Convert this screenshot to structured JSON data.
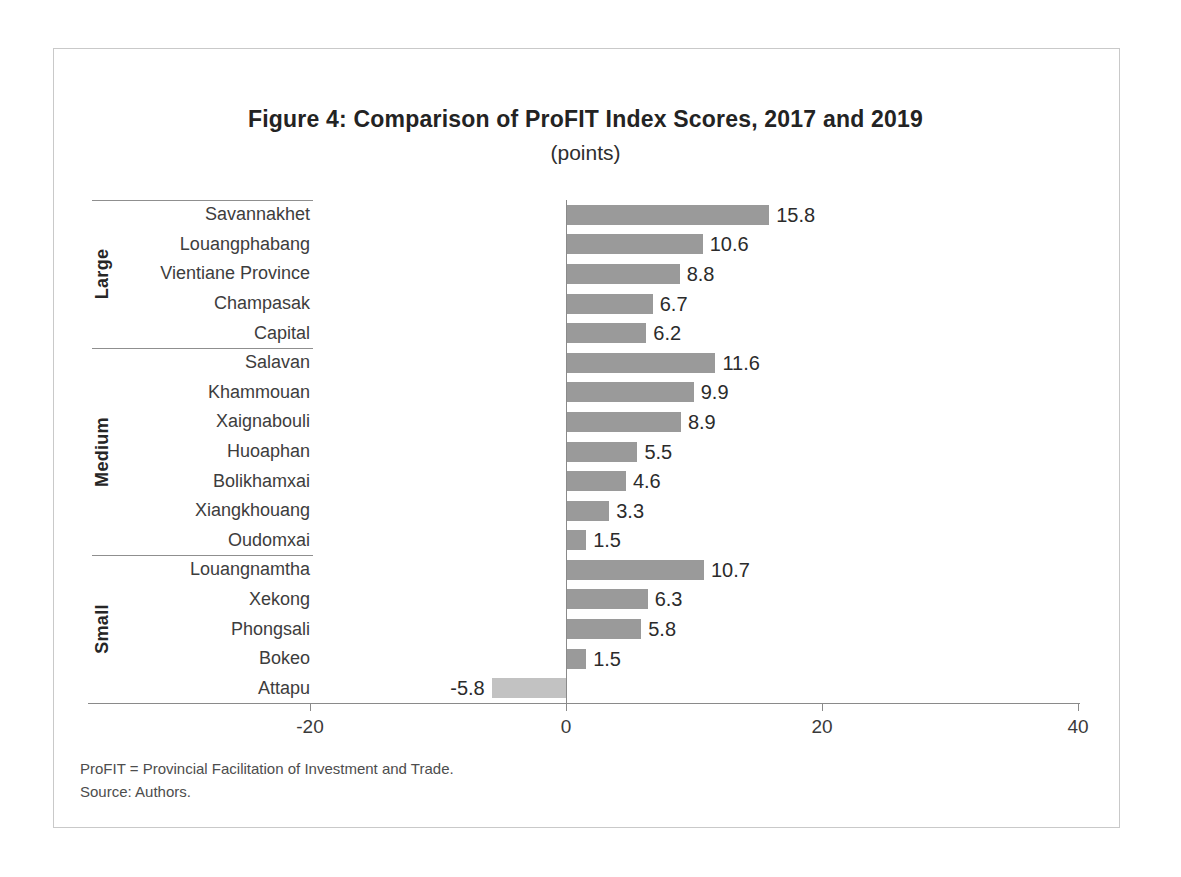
{
  "figure": {
    "title": "Figure 4: Comparison of ProFIT Index Scores, 2017 and 2019",
    "subtitle": "(points)",
    "footnotes": {
      "abbreviation": "ProFIT = Provincial Facilitation of Investment and Trade.",
      "source": "Source: Authors."
    }
  },
  "chart_data": {
    "type": "bar",
    "orientation": "horizontal",
    "title": "Figure 4: Comparison of ProFIT Index Scores, 2017 and 2019",
    "subtitle": "(points)",
    "xlabel": "",
    "ylabel": "",
    "xlim": [
      -20,
      40
    ],
    "x_ticks": [
      "-20",
      "0",
      "20",
      "40"
    ],
    "x_tick_values": [
      -20,
      0,
      20,
      40
    ],
    "grid": false,
    "legend": false,
    "value_labels": true,
    "bar_color": "#9a9a9a",
    "negative_bar_color": "#c2c2c2",
    "axis_color": "#8a8a8a",
    "groups": [
      {
        "name": "Large",
        "items": [
          {
            "label": "Savannakhet",
            "value": 15.8
          },
          {
            "label": "Louangphabang",
            "value": 10.6
          },
          {
            "label": "Vientiane Province",
            "value": 8.8
          },
          {
            "label": "Champasak",
            "value": 6.7
          },
          {
            "label": "Capital",
            "value": 6.2
          }
        ]
      },
      {
        "name": "Medium",
        "items": [
          {
            "label": "Salavan",
            "value": 11.6
          },
          {
            "label": "Khammouan",
            "value": 9.9
          },
          {
            "label": "Xaignabouli",
            "value": 8.9
          },
          {
            "label": "Huoaphan",
            "value": 5.5
          },
          {
            "label": "Bolikhamxai",
            "value": 4.6
          },
          {
            "label": "Xiangkhouang",
            "value": 3.3
          },
          {
            "label": "Oudomxai",
            "value": 1.5
          }
        ]
      },
      {
        "name": "Small",
        "items": [
          {
            "label": "Louangnamtha",
            "value": 10.7
          },
          {
            "label": "Xekong",
            "value": 6.3
          },
          {
            "label": "Phongsali",
            "value": 5.8
          },
          {
            "label": "Bokeo",
            "value": 1.5
          },
          {
            "label": "Attapu",
            "value": -5.8
          }
        ]
      }
    ]
  }
}
